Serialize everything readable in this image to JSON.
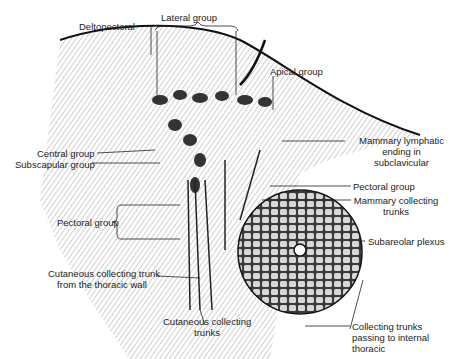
{
  "diagram": {
    "labels": {
      "deltopectoral": "Deltopectoral",
      "lateral_group": "Lateral group",
      "apical_group": "Apical group",
      "mammary_lymphatic_1": "Mammary lymphatic",
      "mammary_lymphatic_2": "ending in",
      "mammary_lymphatic_3": "subclavicular",
      "central_group": "Central group",
      "subscapular_group": "Subscapular group",
      "pectoral_group_right": "Pectoral group",
      "mammary_collecting_1": "Mammary collecting",
      "mammary_collecting_2": "trunks",
      "pectoral_group_left": "Pectoral group",
      "subareolar_plexus": "Subareolar plexus",
      "cutaneous_thoracic_1": "Cutaneous collecting trunk",
      "cutaneous_thoracic_2": "from the thoracic wall",
      "cutaneous_trunks_1": "Cutaneous collecting",
      "cutaneous_trunks_2": "trunks",
      "internal_thoracic_1": "Collecting trunks",
      "internal_thoracic_2": "passing to internal",
      "internal_thoracic_3": "thoracic"
    }
  }
}
